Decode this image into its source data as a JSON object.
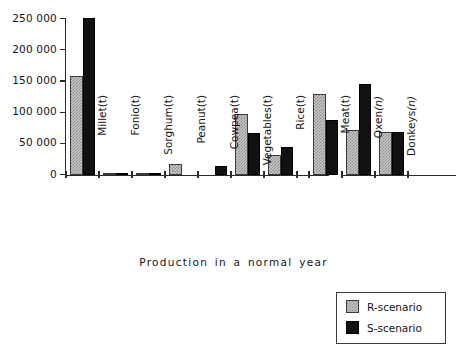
{
  "chart_data": {
    "type": "bar",
    "title": "",
    "xlabel": "Production in a normal year",
    "ylabel": "",
    "ylim": [
      0,
      250000
    ],
    "yticks": [
      0,
      50000,
      100000,
      150000,
      200000,
      250000
    ],
    "ytick_labels": [
      "0",
      "50 000",
      "100 000",
      "150 000",
      "200 000",
      "250 000"
    ],
    "grid": false,
    "legend_position": "bottom-right",
    "categories": [
      {
        "name": "Millet",
        "unit": "(t)",
        "unit_italic": false
      },
      {
        "name": "Fonio",
        "unit": "(t)",
        "unit_italic": false
      },
      {
        "name": "Sorghum",
        "unit": "(t)",
        "unit_italic": false
      },
      {
        "name": "Peanut",
        "unit": "(t)",
        "unit_italic": false
      },
      {
        "name": "Cowpea",
        "unit": "(t)",
        "unit_italic": false
      },
      {
        "name": "Vegetables",
        "unit": "(t)",
        "unit_italic": false
      },
      {
        "name": "Rice",
        "unit": "(t)",
        "unit_italic": false
      },
      {
        "name": "Meat",
        "unit": "(t)",
        "unit_italic": false
      },
      {
        "name": "Oxen",
        "unit": "(n)",
        "unit_italic": true
      },
      {
        "name": "Donkeys",
        "unit": "(n)",
        "unit_italic": true
      }
    ],
    "series": [
      {
        "name": "R-scenario",
        "color": "#c9c9c9",
        "pattern": "stipple",
        "values": [
          158000,
          900,
          1200,
          17000,
          0,
          98000,
          32000,
          129000,
          72000,
          69000
        ]
      },
      {
        "name": "S-scenario",
        "color": "#111111",
        "pattern": "solid",
        "values": [
          251000,
          700,
          1500,
          0,
          15000,
          67000,
          45000,
          88000,
          146000,
          69000
        ]
      }
    ],
    "axis_break_after_category": "Rice"
  },
  "legend": {
    "items": [
      {
        "label": "R-scenario",
        "swatch": "stippled-grey"
      },
      {
        "label": "S-scenario",
        "swatch": "solid-black"
      }
    ]
  },
  "axis": {
    "x_title": "Production in a normal year"
  }
}
